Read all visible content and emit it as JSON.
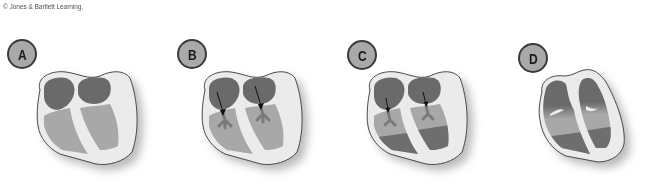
{
  "credit": "© Jones & Bartlett Learning.",
  "colors": {
    "wall": "#ebebeb",
    "outline": "#4a4a4a",
    "atrium": "#6a6a6a",
    "ventricle_light": "#a8a8a8",
    "ventricle_dark": "#6e6e6e",
    "badge_fill": "#a9a9a9"
  },
  "panels": [
    {
      "label": "A",
      "description": "Atria and ventricles at rest; atria dark, ventricles light"
    },
    {
      "label": "B",
      "description": "Atrial blood flows through AV valves into ventricles (arrows)"
    },
    {
      "label": "C",
      "description": "Ventricles partially filled; dark blood rising from apex"
    },
    {
      "label": "D",
      "description": "Ventricles filled; atria emptied"
    }
  ]
}
